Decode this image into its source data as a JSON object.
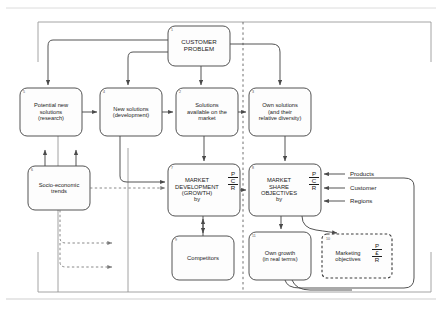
{
  "diagram": {
    "type": "flowchart",
    "colors": {
      "stroke": "#4a4a4a",
      "text": "#1c1c1c",
      "number": "#555555",
      "background": "#ffffff",
      "frame": "#808080"
    },
    "nodes": [
      {
        "id": "n1",
        "number": "1",
        "lines": [
          "CUSTOMER",
          "PROBLEM"
        ],
        "style": "solid",
        "pcr": null
      },
      {
        "id": "n5",
        "number": "5",
        "lines": [
          "Potential new",
          "solutions",
          "(research)"
        ],
        "style": "solid",
        "pcr": null
      },
      {
        "id": "n4",
        "number": "4",
        "lines": [
          "New solutions",
          "(development)"
        ],
        "style": "solid",
        "pcr": null
      },
      {
        "id": "n2",
        "number": "2",
        "lines": [
          "Solutions",
          "available on the",
          "market"
        ],
        "style": "solid",
        "pcr": null
      },
      {
        "id": "n3",
        "number": "3",
        "lines": [
          "Own solutions",
          "(and their",
          "relative diversity)"
        ],
        "style": "solid",
        "pcr": null
      },
      {
        "id": "n6",
        "number": "6",
        "lines": [
          "Socio-economic",
          "trends"
        ],
        "style": "solid",
        "pcr": null
      },
      {
        "id": "n7",
        "number": "7",
        "lines": [
          "MARKET",
          "DEVELOPMENT",
          "(GROWTH)",
          "by"
        ],
        "style": "solid",
        "pcr": [
          "P",
          "C",
          "R"
        ]
      },
      {
        "id": "n8",
        "number": "8",
        "lines": [
          "MARKET",
          "SHARE",
          "OBJECTIVES",
          "by"
        ],
        "style": "solid",
        "pcr": [
          "P",
          "C",
          "R"
        ]
      },
      {
        "id": "n9",
        "number": "9",
        "lines": [
          "Competitors"
        ],
        "style": "solid",
        "pcr": null
      },
      {
        "id": "n11",
        "number": "11",
        "lines": [
          "Own growth",
          "(in real terms)"
        ],
        "style": "solid",
        "pcr": null
      },
      {
        "id": "n10",
        "number": "10",
        "lines": [
          "Marketing",
          "objectives"
        ],
        "style": "dashed",
        "pcr": [
          "P",
          "£",
          "R"
        ]
      }
    ],
    "side_inputs": [
      {
        "label": "Products"
      },
      {
        "label": "Customer"
      },
      {
        "label": "Regions"
      }
    ],
    "divider": {
      "kind": "vertical-dashed",
      "note": "separates market view from own-company view"
    }
  }
}
